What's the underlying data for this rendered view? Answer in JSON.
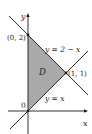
{
  "diagram": {
    "axes": {
      "x_label": "x",
      "y_label": "y",
      "origin_label": "0"
    },
    "region": {
      "label": "D",
      "fill": "#a9a9a9",
      "vertices": [
        "(0,0)",
        "(0,2)",
        "(1,1)"
      ]
    },
    "points": [
      {
        "label": "(0, 2)",
        "x": 0,
        "y": 2
      },
      {
        "label": "(1, 1)",
        "x": 1,
        "y": 1
      }
    ],
    "lines": [
      {
        "label": "y = 2 − x",
        "equation": "y = 2 - x"
      },
      {
        "label": "y = x",
        "equation": "y = x"
      }
    ],
    "colors": {
      "line": "#1a1a1a",
      "region": "#a9a9a9",
      "background": "#ffffff"
    }
  }
}
